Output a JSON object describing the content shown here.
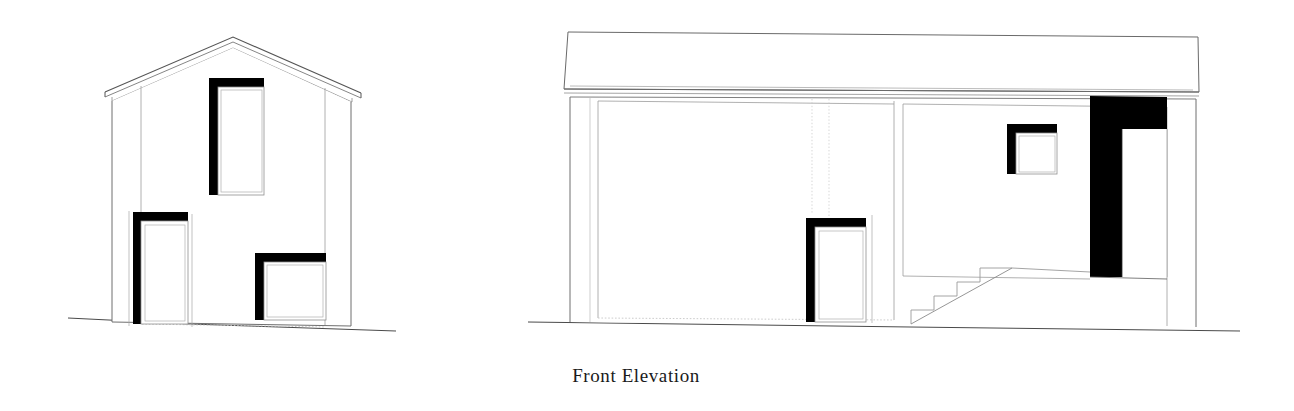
{
  "sheet": {
    "title": "Front Elevation",
    "background_color": "#ffffff",
    "width": 1294,
    "height": 411,
    "drawing_type": "architectural-elevation",
    "line_color_primary": "#1a1a1a",
    "line_color_thin": "#8a8a8a",
    "line_color_hairline": "#b5b5b5",
    "fill_color_opening": "#000000",
    "fill_color_wall": "#ffffff"
  },
  "caption": {
    "label": "Front Elevation"
  },
  "drawings": [
    {
      "id": "left-elevation",
      "name": "gable-end-elevation",
      "description": "Narrow two-storey gable-end volume with pitched roof and three punched openings",
      "ground_line": {
        "x1": 68,
        "y1": 318,
        "x2": 396,
        "y2": 331
      },
      "roof": {
        "type": "gable",
        "peak": {
          "x": 233,
          "y": 37
        },
        "left_eave": {
          "x": 105,
          "y": 92
        },
        "right_eave": {
          "x": 361,
          "y": 93
        },
        "fascia_depth": 6
      },
      "walls": {
        "left_edge_x": 112,
        "right_edge_x": 351,
        "inner_left_x": 141,
        "inner_right_x": 325,
        "top_y": 96,
        "base_y": 324
      },
      "openings": [
        {
          "name": "upper-window",
          "kind": "window",
          "x": 209,
          "y": 78,
          "w": 55,
          "h": 117,
          "reveal_sides": "left-top",
          "reveal_thickness": 9
        },
        {
          "name": "ground-door",
          "kind": "door",
          "x": 133,
          "y": 212,
          "w": 55,
          "h": 112,
          "reveal_sides": "left-top",
          "reveal_thickness": 8
        },
        {
          "name": "ground-window",
          "kind": "window",
          "x": 255,
          "y": 253,
          "w": 71,
          "h": 67,
          "reveal_sides": "left-top",
          "reveal_thickness": 9
        }
      ]
    },
    {
      "id": "right-elevation",
      "name": "front-elevation-main",
      "description": "Wide main elevation with flat roof parapet band, recessed bays, external stair and full-height entrance recess",
      "ground_line": {
        "x1": 528,
        "y1": 322,
        "x2": 1240,
        "y2": 331
      },
      "parapet_band": {
        "top_left": {
          "x": 568,
          "y": 32
        },
        "top_right": {
          "x": 1198,
          "y": 37
        },
        "bottom_left": {
          "x": 564,
          "y": 92
        },
        "bottom_right": {
          "x": 1199,
          "y": 93
        },
        "name": "roof-parapet-band"
      },
      "walls": {
        "left_edge_x": 570,
        "right_edge_x": 1196,
        "inner_left_x": 598,
        "inner_right_x": 1167,
        "top_y": 97,
        "base_y": 322,
        "left_bay_right_x": 894,
        "recess_base_y": 318
      },
      "stair": {
        "name": "external-stair",
        "steps": 4,
        "start": {
          "x": 911,
          "y": 324
        },
        "end": {
          "x": 1012,
          "y": 268
        },
        "tread": 23,
        "riser": 14
      },
      "openings": [
        {
          "name": "left-bay-door",
          "kind": "door",
          "x": 806,
          "y": 218,
          "w": 60,
          "h": 104,
          "reveal_sides": "left-top",
          "reveal_thickness": 9
        },
        {
          "name": "small-square-window",
          "kind": "window",
          "x": 1007,
          "y": 124,
          "w": 50,
          "h": 50,
          "reveal_sides": "left-top",
          "reveal_thickness": 9
        },
        {
          "name": "entrance-recess",
          "kind": "recessed-entrance",
          "x": 1090,
          "y": 96,
          "w": 77,
          "h": 180,
          "jamb_width": 32,
          "lintel_depth": 32,
          "fill": "solid-black"
        }
      ]
    }
  ]
}
